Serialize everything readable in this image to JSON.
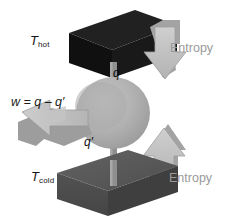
{
  "figure": {
    "background_color": "#ffffff",
    "width": 231,
    "height": 221
  },
  "labels": {
    "t_hot": {
      "symbol": "T",
      "subscript": "hot",
      "text": "Thot"
    },
    "t_cold": {
      "symbol": "T",
      "subscript": "cold",
      "text": "Tcold"
    },
    "work_equation": {
      "text": "w = q – q′",
      "lhs": "w",
      "operator": "=",
      "rhs": "q – q′"
    },
    "heat_in": {
      "text": "q"
    },
    "heat_out": {
      "text": "q′"
    },
    "entropy_top": {
      "text": "Entropy"
    },
    "entropy_bottom": {
      "text": "Entropy"
    }
  },
  "elements": {
    "hot_reservoir": {
      "name": "hot reservoir block",
      "top_color": "#1d1d1d",
      "front_color": "#111111",
      "side_color": "#0a0a0a"
    },
    "cold_reservoir": {
      "name": "cold reservoir block",
      "top_color": "#5a5a5a",
      "front_color": "#4c4c4c",
      "side_color": "#3d3d3d"
    },
    "engine": {
      "name": "engine sphere",
      "color": "#b2b2b2",
      "shadow_color": "#9d9d9d"
    },
    "shaft": {
      "name": "drive shaft",
      "color": "#8e8e8e"
    },
    "entropy_arrow_top": {
      "name": "downward entropy arrow",
      "direction": "down",
      "face_color": "#c2c2c2",
      "side_color": "#a8a8a8"
    },
    "entropy_arrow_bottom": {
      "name": "upward entropy arrow",
      "direction": "up",
      "face_color": "#c2c2c2",
      "side_color": "#a8a8a8"
    },
    "work_arrow": {
      "name": "work output arrow",
      "direction": "down-left",
      "face_color": "#b8b8b8",
      "side_color": "#9c9c9c"
    }
  },
  "colors": {
    "background": "#ffffff",
    "hot": "#111111",
    "cold": "#4c4c4c",
    "arrow": "#c2c2c2",
    "label_dark": "#151515",
    "label_gray": "#9a9a9a"
  }
}
